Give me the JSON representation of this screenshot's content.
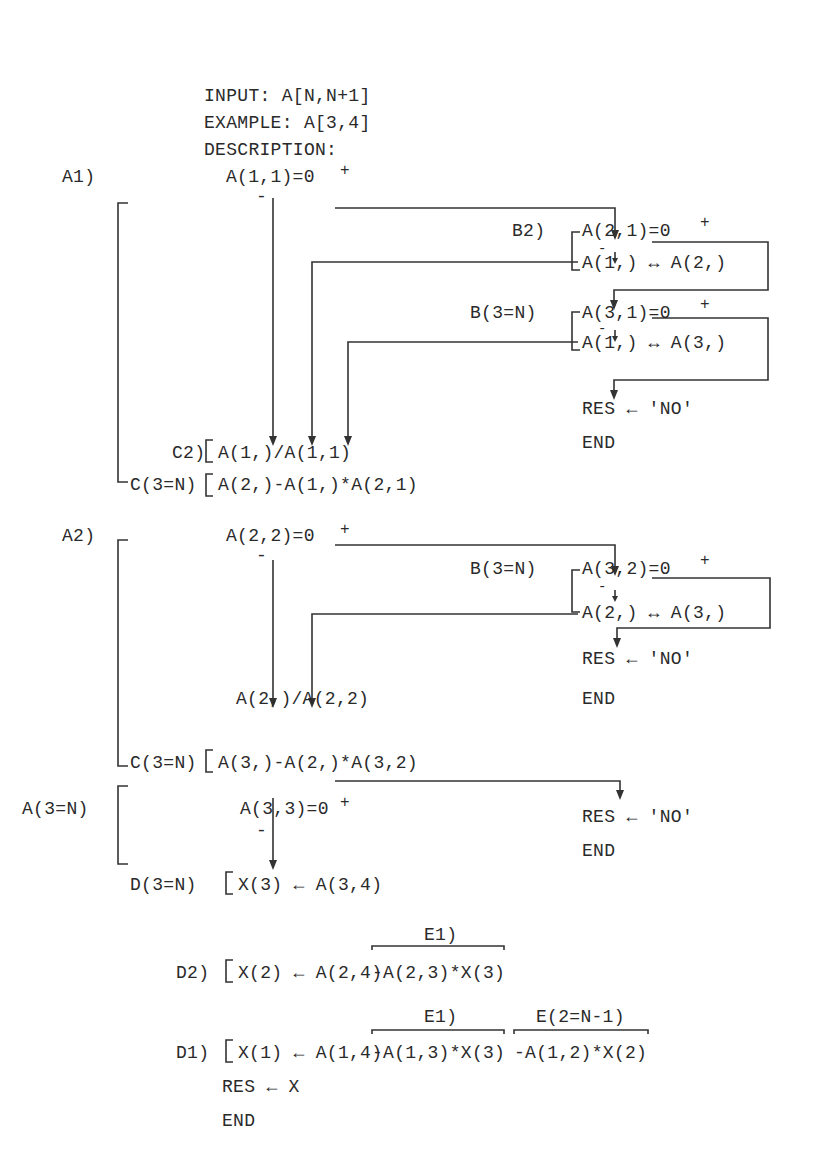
{
  "header": {
    "input": "INPUT: A[N,N+1]",
    "example": "EXAMPLE: A[3,4]",
    "description": "DESCRIPTION:"
  },
  "block_a1": {
    "label": "A1)",
    "test": "A(1,1)=0",
    "plus": "+",
    "minus": "-",
    "b2": {
      "label": "B2)",
      "test": "A(2,1)=0",
      "plus": "+",
      "minus": "-",
      "swap": "A(1,) ↔ A(2,)"
    },
    "b3": {
      "label": "B(3=N)",
      "test": "A(3,1)=0",
      "plus": "+",
      "minus": "-",
      "swap": "A(1,) ↔ A(3,)"
    },
    "res": "RES ← 'NO'",
    "end": "END",
    "c2": {
      "label": "C2)",
      "expr": "A(1,)/A(1,1)"
    },
    "c3": {
      "label": "C(3=N)",
      "expr": "A(2,)-A(1,)*A(2,1)"
    }
  },
  "block_a2": {
    "label": "A2)",
    "test": "A(2,2)=0",
    "plus": "+",
    "minus": "-",
    "b3": {
      "label": "B(3=N)",
      "test": "A(3,2)=0",
      "plus": "+",
      "minus": "-",
      "swap": "A(2,) ↔ A(3,)"
    },
    "res": "RES ← 'NO'",
    "end": "END",
    "div": "A(2,)/A(2,2)",
    "c3": {
      "label": "C(3=N)",
      "expr": "A(3,)-A(2,)*A(3,2)"
    }
  },
  "block_a3": {
    "label": "A(3=N)",
    "test": "A(3,3)=0",
    "plus": "+",
    "minus": "-",
    "res": "RES ← 'NO'",
    "end": "END",
    "d3": {
      "label": "D(3=N)",
      "expr": "X(3) ← A(3,4)"
    }
  },
  "block_d": {
    "d2": {
      "label": "D2)",
      "expr": "X(2) ← A(2,4)",
      "e1_label": "E1)",
      "e1_expr": "-A(2,3)*X(3)"
    },
    "d1": {
      "label": "D1)",
      "expr": "X(1) ← A(1,4)",
      "e1_label": "E1)",
      "e1_expr": "-A(1,3)*X(3)",
      "e2_label": "E(2=N-1)",
      "e2_expr": "-A(1,2)*X(2)"
    },
    "res": "RES ← X",
    "end": "END"
  }
}
